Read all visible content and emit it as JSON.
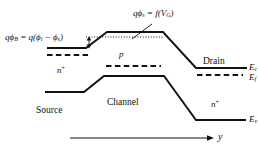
{
  "figure": {
    "type": "energy-band-diagram",
    "background_color": "#ffffff",
    "line_color": "#111111"
  },
  "labels": {
    "barrier_equation": "qϕB = q(ϕi − ϕs)",
    "barrier_eq_parts": {
      "q1": "q",
      "phi1": "ϕ",
      "sub1": "B",
      "eq": " = ",
      "q2": "q",
      "open": "(",
      "phi2": "ϕ",
      "sub2": "i",
      "minus": " − ",
      "phi3": "ϕ",
      "sub3": "s",
      "close": ")"
    },
    "surface_potential_equation": "qϕs = f(VG)",
    "surface_eq_parts": {
      "q": "q",
      "phi": "ϕ",
      "sub": "s",
      "eq": " = ",
      "f": "f",
      "open": "(",
      "v": "V",
      "vsub": "G",
      "close": ")"
    },
    "source_region": "Source",
    "channel_region": "Channel",
    "drain_region": "Drain",
    "source_doping": "n",
    "source_doping_sup": "+",
    "drain_doping": "n",
    "drain_doping_sup": "+",
    "channel_doping": "p",
    "conduction_band": "E",
    "conduction_band_sub": "c",
    "fermi_level": "E",
    "fermi_level_sub": "f",
    "valence_band": "E",
    "valence_band_sub": "v",
    "axis_label": "y"
  },
  "geometry": {
    "conduction_band_path": "M 47,48 L 86,48 L 107,32 L 163,32 L 196,68 L 246,68",
    "valence_band_path": "M 45,92 L 84,92 L 104,76 L 164,76 L 196,120 L 245,120",
    "source_fermi_dash": "M 47,55 L 87,55",
    "channel_fermi_dash": "M 105,66 L 161,66",
    "drain_fermi_dash": "M 197,75 L 242,75",
    "dotted_reference": "M 86,37 L 163,37",
    "barrier_arrow": "M 89,37 L 89,48",
    "leader_line": "M 151,24 L 131,38",
    "axis_arrow": "M 70,138 L 212,138"
  }
}
